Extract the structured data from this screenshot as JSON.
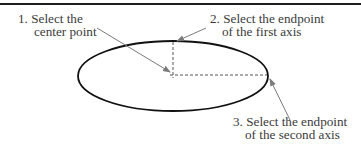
{
  "diagram": {
    "colors": {
      "rule": "#1e1e1e",
      "ellipse": "#111111",
      "dashed": "#555555",
      "arrow": "#7a7a7a",
      "text": "#3a3a3a",
      "background": "#ffffff"
    },
    "ellipse": {
      "cx": 173,
      "cy": 76,
      "rx": 95,
      "ry": 35
    },
    "center_point": {
      "x": 173,
      "y": 75
    },
    "first_axis_endpoint": {
      "x": 173,
      "y": 41
    },
    "second_axis_endpoint": {
      "x": 268,
      "y": 75
    },
    "steps": [
      {
        "number": "1",
        "line1": "1. Select the",
        "line2": "center point",
        "arrow": {
          "from": [
            97,
            28
          ],
          "to": [
            170,
            72
          ]
        }
      },
      {
        "number": "2",
        "line1": "2. Select the endpoint",
        "line2": "of the first axis",
        "arrow": {
          "from": [
            206,
            28
          ],
          "to": [
            176,
            41
          ]
        }
      },
      {
        "number": "3",
        "line1": "3. Select the endpoint",
        "line2": "of the second axis",
        "arrow": {
          "from": [
            290,
            120
          ],
          "to": [
            270,
            78
          ]
        }
      }
    ]
  }
}
